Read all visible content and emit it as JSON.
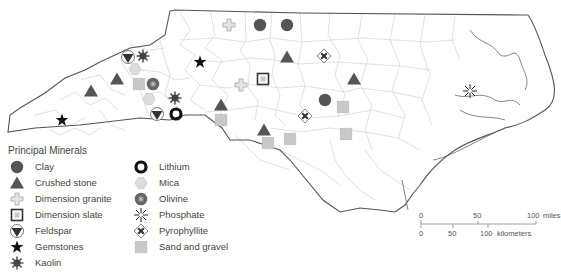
{
  "map": {
    "region": "North Carolina",
    "colors": {
      "state_outline": "#555555",
      "county_lines": "#cfcfcf",
      "symbol_dark": "#555555",
      "symbol_light": "#c8c8c8",
      "symbol_black": "#111111"
    }
  },
  "legend": {
    "title": "Principal Minerals",
    "items": [
      {
        "symbol": "clay-icon",
        "label": "Clay"
      },
      {
        "symbol": "crushed-stone-icon",
        "label": "Crushed stone"
      },
      {
        "symbol": "dimension-granite-icon",
        "label": "Dimension granite"
      },
      {
        "symbol": "dimension-slate-icon",
        "label": "Dimension slate"
      },
      {
        "symbol": "feldspar-icon",
        "label": "Feldspar"
      },
      {
        "symbol": "gemstones-icon",
        "label": "Gemstones"
      },
      {
        "symbol": "kaolin-icon",
        "label": "Kaolin"
      },
      {
        "symbol": "lithium-icon",
        "label": "Lithium"
      },
      {
        "symbol": "mica-icon",
        "label": "Mica"
      },
      {
        "symbol": "olivine-icon",
        "label": "Olivine"
      },
      {
        "symbol": "phosphate-icon",
        "label": "Phosphate"
      },
      {
        "symbol": "pyrophyllite-icon",
        "label": "Pyrophyllite"
      },
      {
        "symbol": "sand-gravel-icon",
        "label": "Sand and gravel"
      }
    ]
  },
  "scale": {
    "miles": {
      "ticks": [
        "0",
        "50",
        "100"
      ],
      "unit": "miles"
    },
    "kilometers": {
      "ticks": [
        "0",
        "50",
        "100"
      ],
      "unit": "kilometers"
    }
  },
  "sites": [
    {
      "type": "clay",
      "x": 260,
      "y": 25
    },
    {
      "type": "clay",
      "x": 287,
      "y": 25
    },
    {
      "type": "clay",
      "x": 325,
      "y": 100
    },
    {
      "type": "crushed",
      "x": 287,
      "y": 57
    },
    {
      "type": "crushed",
      "x": 354,
      "y": 79
    },
    {
      "type": "crushed",
      "x": 91,
      "y": 91
    },
    {
      "type": "crushed",
      "x": 117,
      "y": 79
    },
    {
      "type": "crushed",
      "x": 221,
      "y": 105
    },
    {
      "type": "crushed",
      "x": 264,
      "y": 130
    },
    {
      "type": "granite",
      "x": 229,
      "y": 25
    },
    {
      "type": "granite",
      "x": 241,
      "y": 85
    },
    {
      "type": "slate",
      "x": 263,
      "y": 79
    },
    {
      "type": "feldspar",
      "x": 128,
      "y": 57
    },
    {
      "type": "feldspar",
      "x": 157,
      "y": 114
    },
    {
      "type": "gemstone",
      "x": 200,
      "y": 62
    },
    {
      "type": "gemstone",
      "x": 62,
      "y": 120
    },
    {
      "type": "kaolin",
      "x": 143,
      "y": 56
    },
    {
      "type": "kaolin",
      "x": 175,
      "y": 98
    },
    {
      "type": "lithium",
      "x": 176,
      "y": 114
    },
    {
      "type": "mica",
      "x": 135,
      "y": 69
    },
    {
      "type": "mica",
      "x": 149,
      "y": 99
    },
    {
      "type": "olivine",
      "x": 153,
      "y": 84
    },
    {
      "type": "phosphate",
      "x": 470,
      "y": 91
    },
    {
      "type": "pyro",
      "x": 324,
      "y": 56
    },
    {
      "type": "pyro",
      "x": 305,
      "y": 116
    },
    {
      "type": "sand",
      "x": 139,
      "y": 84
    },
    {
      "type": "sand",
      "x": 221,
      "y": 120
    },
    {
      "type": "sand",
      "x": 268,
      "y": 143
    },
    {
      "type": "sand",
      "x": 290,
      "y": 139
    },
    {
      "type": "sand",
      "x": 343,
      "y": 107
    },
    {
      "type": "sand",
      "x": 346,
      "y": 134
    }
  ]
}
